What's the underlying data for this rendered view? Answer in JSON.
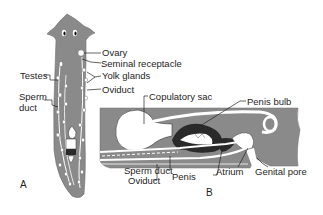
{
  "figure": {
    "panel_a": {
      "letter": "A",
      "labels": {
        "ovary": "Ovary",
        "seminal_receptacle": "Seminal receptacle",
        "yolk_glands": "Yolk glands",
        "oviduct": "Oviduct",
        "testes": "Testes",
        "sperm_duct_line1": "Sperm",
        "sperm_duct_line2": "duct"
      }
    },
    "panel_b": {
      "letter": "B",
      "labels": {
        "copulatory_sac": "Copulatory sac",
        "penis_bulb": "Penis bulb",
        "sperm_duct": "Sperm duct",
        "oviduct": "Oviduct",
        "penis": "Penis",
        "atrium": "Atrium",
        "genital_pore": "Genital pore"
      }
    },
    "colors": {
      "tissue": "#8a8a8a",
      "organ": "#ffffff",
      "dark_tissue": "#2a2a2a",
      "text": "#1e1e1e"
    }
  }
}
